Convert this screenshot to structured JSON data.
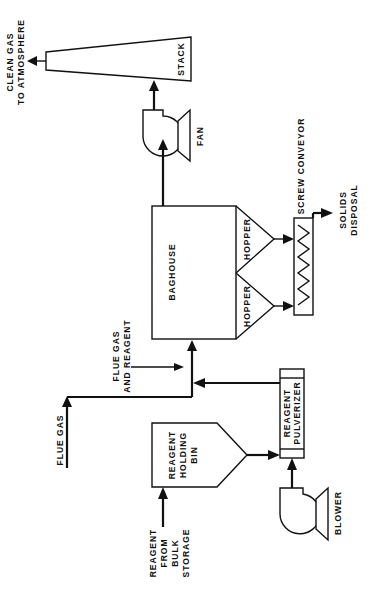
{
  "diagram": {
    "colors": {
      "ink": "#111111",
      "background": "#ffffff"
    },
    "components": {
      "stack": {
        "label": "STACK"
      },
      "fan": {
        "label": "FAN"
      },
      "baghouse": {
        "label": "BAGHOUSE"
      },
      "hopper_1": {
        "label": "HOPPER"
      },
      "hopper_2": {
        "label": "HOPPER"
      },
      "screw_conveyor": {
        "label": "SCREW  CONVEYOR"
      },
      "reagent_pulverizer": {
        "label_line1": "REAGENT",
        "label_line2": "PULVERIZER"
      },
      "reagent_holding_bin": {
        "label_line1": "REAGENT",
        "label_line2": "HOLDING",
        "label_line3": "BIN"
      },
      "blower": {
        "label": "BLOWER"
      }
    },
    "streams": {
      "clean_gas": {
        "line1": "CLEAN  GAS",
        "line2": "TO  ATMOSPHERE"
      },
      "solids_disposal": {
        "line1": "SOLIDS",
        "line2": "DISPOSAL"
      },
      "flue_gas_and_reagent": {
        "line1": "FLUE  GAS",
        "line2": "AND  REAGENT"
      },
      "flue_gas": {
        "label": "FLUE  GAS"
      },
      "reagent_from_bulk": {
        "line1": "REAGENT",
        "line2": "FROM",
        "line3": "BULK",
        "line4": "STORAGE"
      }
    }
  }
}
